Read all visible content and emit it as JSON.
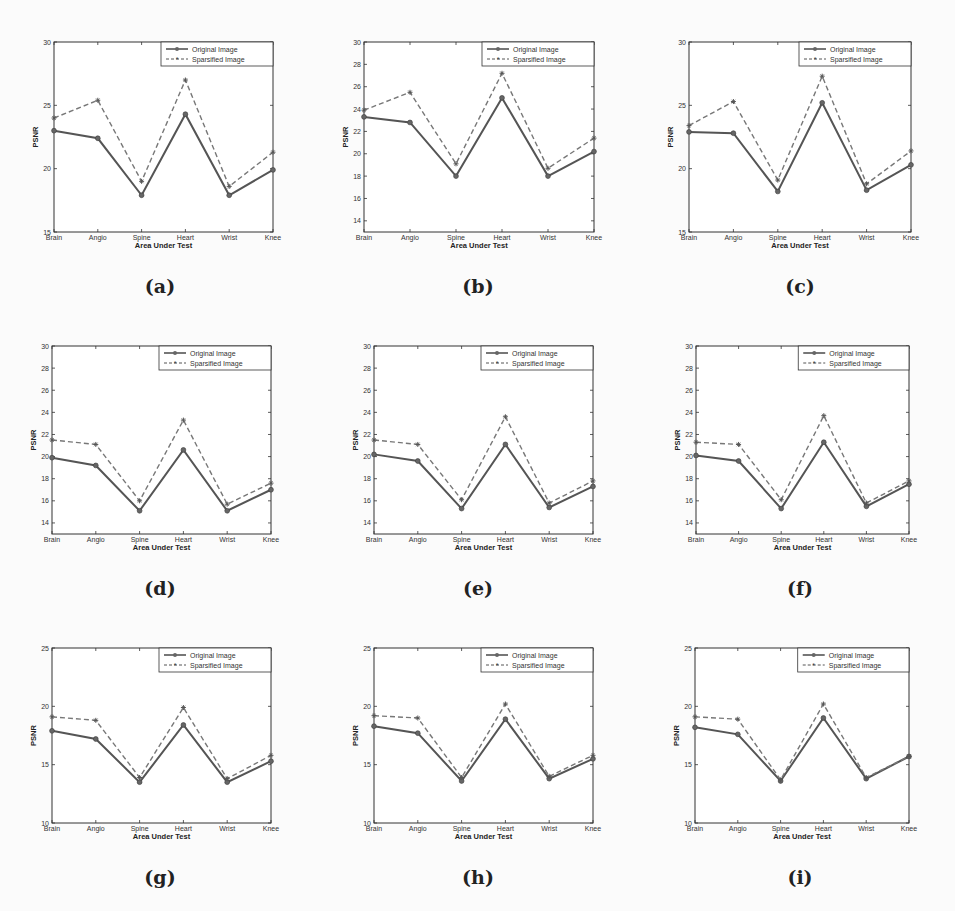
{
  "figure": {
    "panels": [
      "a",
      "b",
      "c",
      "d",
      "e",
      "f",
      "g",
      "h",
      "i"
    ],
    "captions": [
      "(a)",
      "(b)",
      "(c)",
      "(d)",
      "(e)",
      "(f)",
      "(g)",
      "(h)",
      "(i)"
    ]
  },
  "chart_data": [
    {
      "id": "a",
      "type": "line",
      "caption": "(a)",
      "categories": [
        "Brain",
        "Angio",
        "Spine",
        "Heart",
        "Wrist",
        "Knee"
      ],
      "xlabel": "Area Under Test",
      "ylabel": "PSNR",
      "ylim": [
        15,
        30
      ],
      "yticks": [
        15,
        20,
        25,
        30
      ],
      "legend": {
        "position": "upper right",
        "entries": [
          "Original Image",
          "Sparsified Image"
        ]
      },
      "series": [
        {
          "name": "Original Image",
          "style": "solid",
          "marker": "circle",
          "values": [
            23.0,
            22.4,
            17.9,
            24.3,
            17.9,
            19.9
          ]
        },
        {
          "name": "Sparsified Image",
          "style": "dashed",
          "marker": "asterisk",
          "values": [
            24.0,
            25.4,
            19.0,
            27.0,
            18.6,
            21.3
          ]
        }
      ]
    },
    {
      "id": "b",
      "type": "line",
      "caption": "(b)",
      "categories": [
        "Brain",
        "Angio",
        "Spine",
        "Heart",
        "Wrist",
        "Knee"
      ],
      "xlabel": "Area Under Test",
      "ylabel": "PSNR",
      "ylim": [
        13,
        30
      ],
      "yticks": [
        14,
        16,
        18,
        20,
        22,
        24,
        26,
        28,
        30
      ],
      "legend": {
        "position": "upper right",
        "entries": [
          "Original Image",
          "Sparsified Image"
        ]
      },
      "series": [
        {
          "name": "Original Image",
          "style": "solid",
          "marker": "circle",
          "values": [
            23.3,
            22.8,
            18.0,
            25.0,
            18.0,
            20.2
          ]
        },
        {
          "name": "Sparsified Image",
          "style": "dashed",
          "marker": "asterisk",
          "values": [
            23.9,
            25.5,
            19.1,
            27.2,
            18.7,
            21.4
          ]
        }
      ]
    },
    {
      "id": "c",
      "type": "line",
      "caption": "(c)",
      "categories": [
        "Brain",
        "Angio",
        "Spine",
        "Heart",
        "Wrist",
        "Knee"
      ],
      "xlabel": "Area Under Test",
      "ylabel": "PSNR",
      "ylim": [
        15,
        30
      ],
      "yticks": [
        15,
        20,
        25,
        30
      ],
      "legend": {
        "position": "upper right",
        "entries": [
          "Original Image",
          "Sparsified Image"
        ]
      },
      "series": [
        {
          "name": "Original Image",
          "style": "solid",
          "marker": "circle",
          "values": [
            22.9,
            22.8,
            18.2,
            25.2,
            18.3,
            20.3
          ]
        },
        {
          "name": "Sparsified Image",
          "style": "dashed",
          "marker": "asterisk",
          "values": [
            23.4,
            25.3,
            19.1,
            27.3,
            18.8,
            21.4
          ]
        }
      ]
    },
    {
      "id": "d",
      "type": "line",
      "caption": "(d)",
      "categories": [
        "Brain",
        "Angio",
        "Spine",
        "Heart",
        "Wrist",
        "Knee"
      ],
      "xlabel": "Area Under Test",
      "ylabel": "PSNR",
      "ylim": [
        13,
        30
      ],
      "yticks": [
        14,
        16,
        18,
        20,
        22,
        24,
        26,
        28,
        30
      ],
      "legend": {
        "position": "upper right",
        "entries": [
          "Original Image",
          "Sparsified Image"
        ]
      },
      "series": [
        {
          "name": "Original Image",
          "style": "solid",
          "marker": "circle",
          "values": [
            19.9,
            19.2,
            15.1,
            20.6,
            15.1,
            17.0
          ]
        },
        {
          "name": "Sparsified Image",
          "style": "dashed",
          "marker": "asterisk",
          "values": [
            21.5,
            21.1,
            16.0,
            23.3,
            15.7,
            17.6
          ]
        }
      ]
    },
    {
      "id": "e",
      "type": "line",
      "caption": "(e)",
      "categories": [
        "Brain",
        "Angio",
        "Spine",
        "Heart",
        "Wrist",
        "Knee"
      ],
      "xlabel": "Area Under Test",
      "ylabel": "PSNR",
      "ylim": [
        13,
        30
      ],
      "yticks": [
        14,
        16,
        18,
        20,
        22,
        24,
        26,
        28,
        30
      ],
      "legend": {
        "position": "upper right",
        "entries": [
          "Original Image",
          "Sparsified Image"
        ]
      },
      "series": [
        {
          "name": "Original Image",
          "style": "solid",
          "marker": "circle",
          "values": [
            20.2,
            19.6,
            15.3,
            21.1,
            15.4,
            17.3
          ]
        },
        {
          "name": "Sparsified Image",
          "style": "dashed",
          "marker": "asterisk",
          "values": [
            21.5,
            21.1,
            16.1,
            23.6,
            15.8,
            17.8
          ]
        }
      ]
    },
    {
      "id": "f",
      "type": "line",
      "caption": "(f)",
      "categories": [
        "Brain",
        "Angio",
        "Spine",
        "Heart",
        "Wrist",
        "Knee"
      ],
      "xlabel": "Area Under Test",
      "ylabel": "PSNR",
      "ylim": [
        13,
        30
      ],
      "yticks": [
        14,
        16,
        18,
        20,
        22,
        24,
        26,
        28,
        30
      ],
      "legend": {
        "position": "upper right",
        "entries": [
          "Original Image",
          "Sparsified Image"
        ]
      },
      "series": [
        {
          "name": "Original Image",
          "style": "solid",
          "marker": "circle",
          "values": [
            20.1,
            19.6,
            15.3,
            21.3,
            15.5,
            17.5
          ]
        },
        {
          "name": "Sparsified Image",
          "style": "dashed",
          "marker": "asterisk",
          "values": [
            21.3,
            21.1,
            16.1,
            23.7,
            15.8,
            17.8
          ]
        }
      ]
    },
    {
      "id": "g",
      "type": "line",
      "caption": "(g)",
      "categories": [
        "Brain",
        "Angio",
        "Spine",
        "Heart",
        "Wrist",
        "Knee"
      ],
      "xlabel": "Area Under Test",
      "ylabel": "PSNR",
      "ylim": [
        10,
        25
      ],
      "yticks": [
        10,
        15,
        20,
        25
      ],
      "legend": {
        "position": "upper right",
        "entries": [
          "Original Image",
          "Sparsified Image"
        ]
      },
      "series": [
        {
          "name": "Original Image",
          "style": "solid",
          "marker": "circle",
          "values": [
            17.9,
            17.2,
            13.5,
            18.4,
            13.5,
            15.3
          ]
        },
        {
          "name": "Sparsified Image",
          "style": "dashed",
          "marker": "asterisk",
          "values": [
            19.1,
            18.8,
            13.9,
            19.9,
            13.8,
            15.8
          ]
        }
      ]
    },
    {
      "id": "h",
      "type": "line",
      "caption": "(h)",
      "categories": [
        "Brain",
        "Angio",
        "Spine",
        "Heart",
        "Wrist",
        "Knee"
      ],
      "xlabel": "Area Under Test",
      "ylabel": "PSNR",
      "ylim": [
        10,
        25
      ],
      "yticks": [
        10,
        15,
        20,
        25
      ],
      "legend": {
        "position": "upper right",
        "entries": [
          "Original Image",
          "Sparsified Image"
        ]
      },
      "series": [
        {
          "name": "Original Image",
          "style": "solid",
          "marker": "circle",
          "values": [
            18.3,
            17.7,
            13.6,
            18.9,
            13.8,
            15.5
          ]
        },
        {
          "name": "Sparsified Image",
          "style": "dashed",
          "marker": "asterisk",
          "values": [
            19.2,
            19.0,
            13.9,
            20.2,
            14.0,
            15.8
          ]
        }
      ]
    },
    {
      "id": "i",
      "type": "line",
      "caption": "(i)",
      "categories": [
        "Brain",
        "Angio",
        "Spine",
        "Heart",
        "Wrist",
        "Knee"
      ],
      "xlabel": "Area Under Test",
      "ylabel": "PSNR",
      "ylim": [
        10,
        25
      ],
      "yticks": [
        10,
        15,
        20,
        25
      ],
      "legend": {
        "position": "upper right",
        "entries": [
          "Original Image",
          "Sparsified Image"
        ]
      },
      "series": [
        {
          "name": "Original Image",
          "style": "solid",
          "marker": "circle",
          "values": [
            18.2,
            17.6,
            13.6,
            19.0,
            13.8,
            15.7
          ]
        },
        {
          "name": "Sparsified Image",
          "style": "dashed",
          "marker": "asterisk",
          "values": [
            19.1,
            18.9,
            13.7,
            20.2,
            13.9,
            15.7
          ]
        }
      ]
    }
  ]
}
